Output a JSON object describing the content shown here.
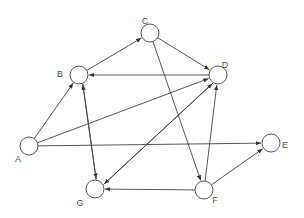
{
  "diagram": {
    "type": "directed-graph",
    "nodes": [
      {
        "id": "A",
        "label": "A",
        "x": 29,
        "y": 146,
        "lx": 18,
        "ly": 160
      },
      {
        "id": "B",
        "label": "B",
        "x": 79,
        "y": 75,
        "lx": 60,
        "ly": 75
      },
      {
        "id": "C",
        "label": "C",
        "x": 150,
        "y": 33,
        "lx": 145,
        "ly": 22
      },
      {
        "id": "D",
        "label": "D",
        "x": 218,
        "y": 75,
        "lx": 225,
        "ly": 66
      },
      {
        "id": "E",
        "label": "E",
        "x": 271,
        "y": 143,
        "lx": 285,
        "ly": 146
      },
      {
        "id": "F",
        "label": "F",
        "x": 204,
        "y": 190,
        "lx": 215,
        "ly": 201
      },
      {
        "id": "G",
        "label": "G",
        "x": 95,
        "y": 189,
        "lx": 80,
        "ly": 204
      }
    ],
    "edges": [
      {
        "from": "A",
        "to": "B"
      },
      {
        "from": "A",
        "to": "D"
      },
      {
        "from": "A",
        "to": "E"
      },
      {
        "from": "B",
        "to": "C"
      },
      {
        "from": "D",
        "to": "B"
      },
      {
        "from": "C",
        "to": "D"
      },
      {
        "from": "C",
        "to": "F"
      },
      {
        "from": "B",
        "to": "G",
        "offset": -2.5
      },
      {
        "from": "G",
        "to": "B",
        "offset": -2.5
      },
      {
        "from": "D",
        "to": "G",
        "offset": -2.5
      },
      {
        "from": "G",
        "to": "D",
        "offset": -2.5
      },
      {
        "from": "F",
        "to": "G"
      },
      {
        "from": "F",
        "to": "D"
      },
      {
        "from": "F",
        "to": "E"
      }
    ],
    "style": {
      "stroke": "#444444",
      "node_fill": "#ffffff",
      "node_radius": 9
    }
  }
}
